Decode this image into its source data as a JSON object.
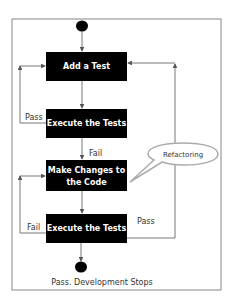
{
  "diagram": {
    "type": "flowchart",
    "colors": {
      "box_fill": "#000000",
      "box_text": "#ffffff",
      "line": "#555555",
      "frame": "#777777"
    },
    "nodes": [
      {
        "id": "start",
        "shape": "circle"
      },
      {
        "id": "add_test",
        "label": "Add a Test"
      },
      {
        "id": "execute_1",
        "label": "Execute the Tests"
      },
      {
        "id": "make_changes",
        "label_line1": "Make Changes to",
        "label_line2": "the Code"
      },
      {
        "id": "execute_2",
        "label": "Execute the Tests"
      },
      {
        "id": "end",
        "shape": "circle"
      }
    ],
    "edge_labels": {
      "pass_top": "Pass",
      "fail_mid": "Fail",
      "fail_bottom": "Fail",
      "pass_right": "Pass"
    },
    "callout": {
      "label": "Refactoring"
    },
    "end_caption": "Pass. Development Stops"
  }
}
